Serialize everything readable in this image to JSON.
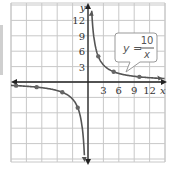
{
  "chart_data": {
    "type": "line",
    "title": "",
    "annotation": {
      "lhs": "y",
      "numerator": "10",
      "denominator": "x"
    },
    "xlabel": "x",
    "ylabel": "y",
    "xlim": [
      -15,
      15
    ],
    "ylim": [
      -15,
      15
    ],
    "x_ticks": [
      "3",
      "6",
      "9",
      "12"
    ],
    "y_ticks": [
      "3",
      "6",
      "9",
      "12"
    ],
    "grid": true,
    "series": [
      {
        "name": "y = 10/x",
        "points": [
          [
            -14,
            -0.71
          ],
          [
            -10,
            -1
          ],
          [
            -5,
            -2
          ],
          [
            -2,
            -5
          ],
          [
            2,
            5
          ],
          [
            5,
            2
          ],
          [
            10,
            1
          ]
        ]
      }
    ],
    "colors": {
      "curve": "#555555",
      "grid": "#c8c8c8",
      "axis": "#222222"
    }
  }
}
